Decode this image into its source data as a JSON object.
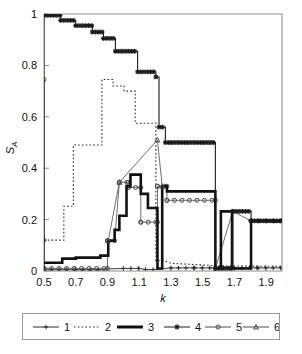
{
  "chart_data": {
    "type": "line",
    "title": "",
    "xlabel": "k",
    "ylabel": "S_A",
    "ylabel_base": "S",
    "ylabel_sub": "A",
    "xlim": [
      0.5,
      2.0
    ],
    "ylim": [
      0,
      1
    ],
    "grid": false,
    "xticks": [
      0.5,
      0.7,
      0.9,
      1.1,
      1.3,
      1.5,
      1.7,
      1.9
    ],
    "xtick_labels": [
      "0.5",
      "0.7",
      "0.9",
      "1.1",
      "1.3",
      "1.5",
      "1.7",
      "1.9"
    ],
    "yticks": [
      0,
      0.2,
      0.4,
      0.6,
      0.8,
      1
    ],
    "ytick_labels": [
      "0",
      "0.2",
      "0.4",
      "0.6",
      "0.8",
      "1"
    ],
    "legend_position": "below-axes",
    "legend": [
      {
        "label": "1",
        "marker": "plus",
        "style": "thin-solid",
        "color": "#2a2a2a"
      },
      {
        "label": "2",
        "marker": "none",
        "style": "dotted",
        "color": "#2a2a2a"
      },
      {
        "label": "3",
        "marker": "none",
        "style": "thick-solid",
        "color": "#111111"
      },
      {
        "label": "4",
        "marker": "star",
        "style": "solid",
        "color": "#1a1a1a"
      },
      {
        "label": "5",
        "marker": "open-circle",
        "style": "thin-solid",
        "color": "#444444"
      },
      {
        "label": "6",
        "marker": "open-triangle",
        "style": "thin-solid",
        "color": "#444444"
      }
    ],
    "series": [
      {
        "name": "1",
        "label": "1",
        "marker": "plus",
        "points": [
          [
            0.5,
            0.005
          ],
          [
            0.7,
            0.005
          ],
          [
            0.86,
            0.005
          ],
          [
            0.9,
            0.008
          ],
          [
            1.0,
            0.01
          ],
          [
            1.1,
            0.01
          ],
          [
            1.14,
            0.006
          ],
          [
            1.2,
            0.006
          ],
          [
            1.3,
            0.012
          ],
          [
            1.45,
            0.012
          ],
          [
            1.58,
            0.012
          ],
          [
            1.7,
            0.012
          ],
          [
            1.85,
            0.012
          ],
          [
            2.0,
            0.012
          ]
        ]
      },
      {
        "name": "2",
        "label": "2",
        "marker": "none",
        "points": [
          [
            0.5,
            0.12
          ],
          [
            0.625,
            0.12
          ],
          [
            0.625,
            0.252
          ],
          [
            0.685,
            0.252
          ],
          [
            0.685,
            0.49
          ],
          [
            0.865,
            0.49
          ],
          [
            0.865,
            0.745
          ],
          [
            0.935,
            0.745
          ],
          [
            0.935,
            0.72
          ],
          [
            1.005,
            0.72
          ],
          [
            1.005,
            0.7
          ],
          [
            1.075,
            0.7
          ],
          [
            1.075,
            0.575
          ],
          [
            1.205,
            0.575
          ],
          [
            1.205,
            0.04
          ],
          [
            1.26,
            0.04
          ],
          [
            1.3,
            0.03
          ],
          [
            1.6,
            0.02
          ],
          [
            2.0,
            0.018
          ]
        ]
      },
      {
        "name": "3",
        "label": "3",
        "marker": "none",
        "points": [
          [
            0.5,
            0.032
          ],
          [
            0.615,
            0.032
          ],
          [
            0.615,
            0.048
          ],
          [
            0.7,
            0.048
          ],
          [
            0.7,
            0.052
          ],
          [
            0.855,
            0.052
          ],
          [
            0.855,
            0.06
          ],
          [
            0.905,
            0.06
          ],
          [
            0.905,
            0.118
          ],
          [
            0.945,
            0.118
          ],
          [
            0.945,
            0.16
          ],
          [
            0.975,
            0.16
          ],
          [
            0.975,
            0.215
          ],
          [
            1.02,
            0.215
          ],
          [
            1.02,
            0.33
          ],
          [
            1.045,
            0.33
          ],
          [
            1.045,
            0.375
          ],
          [
            1.11,
            0.375
          ],
          [
            1.11,
            0.3
          ],
          [
            1.155,
            0.3
          ],
          [
            1.155,
            0.245
          ],
          [
            1.215,
            0.245
          ],
          [
            1.215,
            0.01
          ],
          [
            1.245,
            0.01
          ],
          [
            1.245,
            0.33
          ],
          [
            1.275,
            0.33
          ],
          [
            1.275,
            0.31
          ],
          [
            1.58,
            0.31
          ],
          [
            1.58,
            0.01
          ],
          [
            1.615,
            0.01
          ],
          [
            1.615,
            0.232
          ],
          [
            1.685,
            0.232
          ],
          [
            1.685,
            0.01
          ],
          [
            1.805,
            0.01
          ],
          [
            1.805,
            0.195
          ],
          [
            2.0,
            0.195
          ]
        ]
      },
      {
        "name": "4",
        "label": "4",
        "marker": "star",
        "points": [
          [
            0.5,
            0.01
          ],
          [
            0.5,
            0.995
          ],
          [
            0.605,
            0.995
          ],
          [
            0.605,
            0.975
          ],
          [
            0.7,
            0.975
          ],
          [
            0.7,
            0.955
          ],
          [
            0.805,
            0.955
          ],
          [
            0.805,
            0.93
          ],
          [
            0.875,
            0.93
          ],
          [
            0.875,
            0.905
          ],
          [
            0.95,
            0.905
          ],
          [
            0.95,
            0.855
          ],
          [
            1.09,
            0.855
          ],
          [
            1.09,
            0.775
          ],
          [
            1.205,
            0.775
          ],
          [
            1.205,
            0.755
          ],
          [
            1.225,
            0.755
          ],
          [
            1.225,
            0.56
          ],
          [
            1.265,
            0.56
          ],
          [
            1.265,
            0.5
          ],
          [
            1.58,
            0.5
          ],
          [
            1.58,
            0.01
          ],
          [
            1.69,
            0.01
          ],
          [
            1.69,
            0.232
          ],
          [
            1.805,
            0.232
          ],
          [
            1.805,
            0.195
          ],
          [
            2.0,
            0.195
          ]
        ]
      },
      {
        "name": "5",
        "label": "5",
        "marker": "open-circle",
        "points": [
          [
            0.5,
            0.745
          ],
          [
            0.5,
            0.12
          ],
          [
            0.5,
            0.01
          ],
          [
            0.9,
            0.01
          ],
          [
            0.9,
            0.118
          ],
          [
            0.945,
            0.118
          ],
          [
            0.975,
            0.345
          ],
          [
            1.03,
            0.345
          ],
          [
            1.03,
            0.325
          ],
          [
            1.11,
            0.325
          ],
          [
            1.11,
            0.19
          ],
          [
            1.215,
            0.19
          ],
          [
            1.215,
            0.33
          ],
          [
            1.275,
            0.33
          ],
          [
            1.275,
            0.275
          ],
          [
            1.58,
            0.275
          ],
          [
            1.58,
            0.01
          ],
          [
            1.69,
            0.232
          ],
          [
            1.805,
            0.195
          ],
          [
            2.0,
            0.195
          ]
        ]
      },
      {
        "name": "6",
        "label": "6",
        "marker": "open-triangle",
        "points": [
          [
            0.905,
            0.118
          ],
          [
            0.975,
            0.345
          ],
          [
            1.215,
            0.51
          ],
          [
            1.245,
            0.33
          ]
        ]
      }
    ],
    "annotations": [
      {
        "text": "open circle at left axis",
        "x": 0.5,
        "y": 0.745
      },
      {
        "text": "triangle spike",
        "x": 1.215,
        "y": 0.51
      }
    ]
  },
  "figure": {
    "background": "#ffffff",
    "frame_color": "#8c8c8c",
    "axis_text_color": "#111111"
  }
}
